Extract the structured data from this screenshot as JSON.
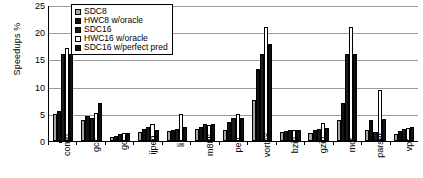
{
  "chart_data": {
    "type": "bar",
    "title": "",
    "xlabel": "",
    "ylabel": "Speedups %",
    "ylim": [
      0,
      25
    ],
    "yticks": [
      0,
      5,
      10,
      15,
      20,
      25
    ],
    "grid": true,
    "legend_position": "top-left-inside",
    "categories": [
      "comp",
      "gcc",
      "go",
      "ijpeg",
      "li",
      "m88k",
      "perl",
      "vortex",
      "bzip",
      "gzip",
      "mcf",
      "parser",
      "vpr"
    ],
    "series": [
      {
        "name": "SDC8",
        "color": "#a6a6a6",
        "values": [
          5.0,
          3.8,
          0.8,
          1.7,
          1.8,
          2.2,
          2.0,
          7.6,
          1.6,
          1.4,
          3.8,
          2.0,
          1.3
        ]
      },
      {
        "name": "HWC8 w/oracle",
        "color": "#111111",
        "values": [
          5.5,
          4.6,
          1.0,
          2.2,
          2.1,
          2.6,
          3.5,
          13.2,
          1.9,
          2.0,
          6.9,
          3.8,
          1.8
        ]
      },
      {
        "name": "SDC16",
        "color": "#1b1b1b",
        "values": [
          16.0,
          4.3,
          1.3,
          2.6,
          2.3,
          3.2,
          4.3,
          16.0,
          2.0,
          2.2,
          16.0,
          1.7,
          2.2
        ]
      },
      {
        "name": "HWC16 w/oracle",
        "color": "#ffffff",
        "values": [
          17.1,
          5.1,
          1.4,
          3.2,
          5.0,
          2.9,
          5.0,
          21.0,
          2.1,
          3.4,
          21.0,
          9.4,
          2.4
        ]
      },
      {
        "name": "SDC16 w/perfect pred",
        "color": "#111111",
        "values": [
          16.0,
          7.0,
          1.5,
          2.1,
          2.5,
          3.1,
          4.2,
          17.8,
          2.0,
          2.4,
          16.0,
          4.0,
          2.6
        ]
      }
    ]
  },
  "legend": {
    "items": [
      {
        "label": "SDC8"
      },
      {
        "label": "HWC8 w/oracle"
      },
      {
        "label": "SDC16"
      },
      {
        "label": "HWC16 w/oracle"
      },
      {
        "label": "SDC16 w/perfect pred"
      }
    ]
  }
}
